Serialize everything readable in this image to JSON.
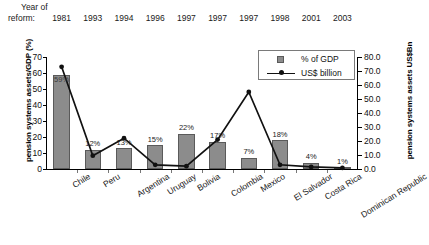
{
  "header": {
    "line1": "Year of",
    "line2": "reform:"
  },
  "chart_data": {
    "type": "bar",
    "title": "",
    "xlabel": "",
    "ylabel": "pension systems assets/GDP (%)",
    "ylabel_right": "pension systems assets US$Bn",
    "categories": [
      "Chile",
      "Peru",
      "Argentina",
      "Uruguay",
      "Bolivia",
      "Colombia",
      "Mexico",
      "El Salvador",
      "Costa Rica",
      "Dominican Republic"
    ],
    "reform_years": [
      "1981",
      "1993",
      "1994",
      "1996",
      "1997",
      "1997",
      "1997",
      "1998",
      "2001",
      "2003"
    ],
    "ylim": [
      0,
      70
    ],
    "yticks": [
      "0",
      "10",
      "20",
      "30",
      "40",
      "50",
      "60",
      "70"
    ],
    "ylim_right": [
      0,
      80
    ],
    "yticks_right": [
      "0.0",
      "10.0",
      "20.0",
      "30.0",
      "40.0",
      "50.0",
      "60.0",
      "70.0",
      "80.0"
    ],
    "grid": false,
    "legend_position": "top-right",
    "series": [
      {
        "name": "% of GDP",
        "type": "bar",
        "axis": "left",
        "color": "#8c8c8c",
        "values": [
          59,
          12,
          13,
          15,
          22,
          17,
          7,
          18,
          4,
          1
        ],
        "labels": [
          "59%",
          "12%",
          "13%",
          "15%",
          "22%",
          "17%",
          "7%",
          "18%",
          "4%",
          "1%"
        ]
      },
      {
        "name": "US$ billion",
        "type": "line",
        "axis": "right",
        "color": "#111111",
        "values": [
          73.0,
          9.5,
          22.0,
          3.0,
          2.0,
          21.0,
          55.0,
          3.0,
          1.5,
          0.8
        ]
      }
    ]
  },
  "legend": {
    "items": [
      {
        "label": "% of GDP",
        "marker": "square-swatch"
      },
      {
        "label": "US$ billion",
        "marker": "line-with-dot"
      }
    ]
  }
}
